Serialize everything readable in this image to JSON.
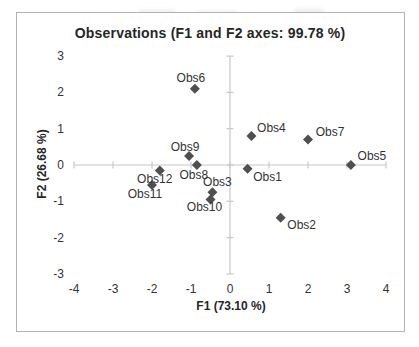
{
  "chart": {
    "colors": {
      "marker": "#4f4f4f",
      "axis_line": "#c8c8c8",
      "text": "#333333",
      "title_text": "#262626",
      "frame_border": "#b3b3b3"
    }
  },
  "chart_data": {
    "type": "scatter",
    "title": "Observations (F1 and F2 axes: 99.78 %)",
    "xlabel": "F1 (73.10 %)",
    "ylabel": "F2 (26.68 %)",
    "xlim": [
      -4,
      4
    ],
    "ylim": [
      -3,
      3
    ],
    "x_ticks": [
      -4,
      -3,
      -2,
      -1,
      0,
      1,
      2,
      3,
      4
    ],
    "y_ticks": [
      3,
      2,
      1,
      0,
      -1,
      -2,
      -3
    ],
    "grid": false,
    "legend": false,
    "marker": "diamond",
    "points": [
      {
        "label": "Obs1",
        "x": 0.45,
        "y": -0.1,
        "label_dx": 20,
        "label_dy": 8
      },
      {
        "label": "Obs2",
        "x": 1.3,
        "y": -1.45,
        "label_dx": 21,
        "label_dy": 7
      },
      {
        "label": "Obs3",
        "x": -0.45,
        "y": -0.75,
        "label_dx": 5,
        "label_dy": -10
      },
      {
        "label": "Obs4",
        "x": 0.55,
        "y": 0.8,
        "label_dx": 20,
        "label_dy": -8
      },
      {
        "label": "Obs5",
        "x": 3.1,
        "y": 0.0,
        "label_dx": 21,
        "label_dy": -9
      },
      {
        "label": "Obs6",
        "x": -0.9,
        "y": 2.1,
        "label_dx": -4,
        "label_dy": -11
      },
      {
        "label": "Obs7",
        "x": 2.0,
        "y": 0.7,
        "label_dx": 22,
        "label_dy": -8
      },
      {
        "label": "Obs8",
        "x": -0.85,
        "y": 0.0,
        "label_dx": -3,
        "label_dy": 10
      },
      {
        "label": "Obs9",
        "x": -1.05,
        "y": 0.25,
        "label_dx": -4,
        "label_dy": -9
      },
      {
        "label": "Obs10",
        "x": -0.5,
        "y": -0.95,
        "label_dx": -6,
        "label_dy": 8
      },
      {
        "label": "Obs11",
        "x": -2.0,
        "y": -0.55,
        "label_dx": -7,
        "label_dy": 9
      },
      {
        "label": "Obs12",
        "x": -1.8,
        "y": -0.15,
        "label_dx": -5,
        "label_dy": 9
      }
    ]
  }
}
